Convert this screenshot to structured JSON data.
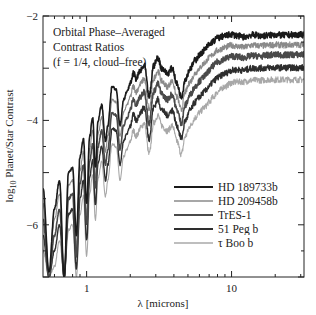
{
  "chart_data": {
    "type": "line",
    "title": "",
    "annotation": [
      "Orbital Phase–Averaged",
      "Contrast Ratios",
      "(f = 1/4, cloud–free)"
    ],
    "xlabel": "λ [microns]",
    "ylabel": "log₁₀ Planet/Star Contrast",
    "ylabel_parts": {
      "prefix": "log",
      "sub": "10",
      "rest": " Planet/Star Contrast"
    },
    "xscale": "log",
    "xlim": [
      0.5,
      31.6
    ],
    "ylim": [
      -7,
      -2
    ],
    "xticks": [
      {
        "value": 1,
        "label": "1"
      },
      {
        "value": 10,
        "label": "10"
      }
    ],
    "yticks": [
      {
        "value": -2,
        "label": "−2"
      },
      {
        "value": -4,
        "label": "−4"
      },
      {
        "value": -6,
        "label": "−6"
      }
    ],
    "grid": false,
    "legend_position": "lower right",
    "x": [
      0.5,
      0.55,
      0.6,
      0.65,
      0.7,
      0.75,
      0.8,
      0.85,
      0.9,
      0.95,
      1.0,
      1.05,
      1.1,
      1.15,
      1.2,
      1.27,
      1.35,
      1.4,
      1.5,
      1.6,
      1.7,
      1.8,
      1.9,
      2.0,
      2.1,
      2.2,
      2.35,
      2.5,
      2.7,
      2.9,
      3.1,
      3.3,
      3.6,
      3.9,
      4.2,
      4.5,
      4.8,
      5.2,
      5.6,
      6.0,
      6.5,
      7.0,
      7.5,
      8.0,
      9.0,
      10.0,
      11.0,
      12.0,
      14.0,
      16.0,
      18.0,
      20.0,
      23.0,
      26.0,
      30.0
    ],
    "series": [
      {
        "name": "HD 189733b",
        "color": "#1a1a1a",
        "width": 1.6,
        "values": [
          -5.3,
          -6.9,
          -5.7,
          -5.15,
          -7.0,
          -5.0,
          -4.9,
          -6.2,
          -4.7,
          -4.35,
          -5.6,
          -4.3,
          -3.95,
          -4.9,
          -4.0,
          -3.7,
          -4.4,
          -4.1,
          -3.35,
          -3.4,
          -4.1,
          -3.6,
          -3.45,
          -3.3,
          -3.1,
          -3.2,
          -3.05,
          -2.95,
          -3.55,
          -2.95,
          -2.8,
          -3.0,
          -3.1,
          -3.0,
          -3.3,
          -3.55,
          -3.2,
          -3.0,
          -2.85,
          -2.75,
          -2.65,
          -2.55,
          -2.48,
          -2.42,
          -2.38,
          -2.35,
          -2.38,
          -2.4,
          -2.36,
          -2.38,
          -2.37,
          -2.36,
          -2.37,
          -2.36,
          -2.36
        ]
      },
      {
        "name": "HD 209458b",
        "color": "#8a8a8a",
        "width": 1.1,
        "values": [
          -5.6,
          -6.9,
          -5.9,
          -5.4,
          -7.0,
          -5.25,
          -5.15,
          -6.4,
          -4.95,
          -4.6,
          -5.8,
          -4.55,
          -4.2,
          -5.1,
          -4.25,
          -3.95,
          -4.6,
          -4.3,
          -3.6,
          -3.65,
          -4.3,
          -3.85,
          -3.7,
          -3.55,
          -3.35,
          -3.45,
          -3.3,
          -3.2,
          -3.8,
          -3.2,
          -3.05,
          -3.25,
          -3.35,
          -3.25,
          -3.55,
          -3.8,
          -3.45,
          -3.25,
          -3.1,
          -3.0,
          -2.9,
          -2.8,
          -2.72,
          -2.66,
          -2.6,
          -2.56,
          -2.58,
          -2.6,
          -2.56,
          -2.57,
          -2.56,
          -2.55,
          -2.56,
          -2.55,
          -2.55
        ]
      },
      {
        "name": "TrES-1",
        "color": "#4a4a4a",
        "width": 1.6,
        "values": [
          -5.9,
          -7.0,
          -6.2,
          -5.7,
          -7.0,
          -5.5,
          -5.4,
          -6.6,
          -5.2,
          -4.85,
          -6.0,
          -4.8,
          -4.45,
          -5.3,
          -4.5,
          -4.2,
          -4.85,
          -4.55,
          -3.85,
          -3.9,
          -4.55,
          -4.1,
          -3.95,
          -3.8,
          -3.6,
          -3.7,
          -3.55,
          -3.45,
          -4.05,
          -3.45,
          -3.3,
          -3.5,
          -3.6,
          -3.5,
          -3.8,
          -4.05,
          -3.7,
          -3.5,
          -3.35,
          -3.25,
          -3.15,
          -3.05,
          -2.95,
          -2.88,
          -2.82,
          -2.77,
          -2.78,
          -2.8,
          -2.76,
          -2.77,
          -2.75,
          -2.74,
          -2.75,
          -2.74,
          -2.74
        ]
      },
      {
        "name": "51 Peg b",
        "color": "#2e2e2e",
        "width": 1.4,
        "values": [
          -6.2,
          -7.0,
          -6.5,
          -6.0,
          -7.0,
          -5.8,
          -5.7,
          -6.85,
          -5.5,
          -5.15,
          -6.3,
          -5.1,
          -4.75,
          -5.6,
          -4.8,
          -4.5,
          -5.15,
          -4.85,
          -4.15,
          -4.2,
          -4.85,
          -4.4,
          -4.25,
          -4.1,
          -3.9,
          -4.0,
          -3.85,
          -3.75,
          -4.35,
          -3.75,
          -3.6,
          -3.8,
          -3.9,
          -3.8,
          -4.1,
          -4.35,
          -4.0,
          -3.8,
          -3.65,
          -3.55,
          -3.45,
          -3.35,
          -3.25,
          -3.18,
          -3.1,
          -3.04,
          -3.03,
          -3.04,
          -3.0,
          -3.0,
          -2.99,
          -2.99,
          -2.99,
          -2.99,
          -2.99
        ]
      },
      {
        "name": "τ Boo b",
        "color": "#a8a8a8",
        "width": 1.1,
        "values": [
          -6.5,
          -7.0,
          -6.8,
          -6.3,
          -7.0,
          -6.1,
          -6.0,
          -7.0,
          -5.8,
          -5.45,
          -6.6,
          -5.4,
          -5.05,
          -5.9,
          -5.1,
          -4.8,
          -5.45,
          -5.15,
          -4.45,
          -4.5,
          -5.15,
          -4.7,
          -4.55,
          -4.4,
          -4.2,
          -4.3,
          -4.15,
          -4.05,
          -4.65,
          -4.05,
          -3.9,
          -4.1,
          -4.2,
          -4.1,
          -4.4,
          -4.65,
          -4.3,
          -4.1,
          -3.95,
          -3.85,
          -3.75,
          -3.65,
          -3.55,
          -3.45,
          -3.35,
          -3.28,
          -3.26,
          -3.26,
          -3.23,
          -3.23,
          -3.22,
          -3.22,
          -3.22,
          -3.22,
          -3.22
        ]
      }
    ]
  }
}
